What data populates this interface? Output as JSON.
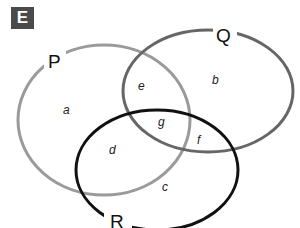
{
  "figure": {
    "badge": "E",
    "sets": [
      {
        "name": "P",
        "color": "#9a9a9a"
      },
      {
        "name": "Q",
        "color": "#666666"
      },
      {
        "name": "R",
        "color": "#111111"
      }
    ],
    "regions": {
      "a": "a",
      "b": "b",
      "c": "c",
      "d": "d",
      "e": "e",
      "f": "f",
      "g": "g"
    }
  }
}
